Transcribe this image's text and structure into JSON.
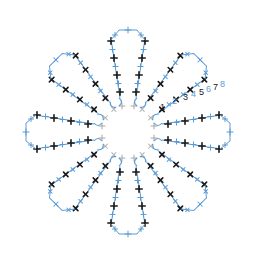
{
  "diagram": {
    "center": [
      128,
      132
    ],
    "petal_count": 8,
    "colors": {
      "black_stitch": "#1a1a1a",
      "blue_stitch": "#5b9bd5",
      "gray_stitch": "#a8a8a8",
      "background": "#ffffff"
    },
    "row_numbers": [
      {
        "label": "1",
        "x": 160,
        "y": 110,
        "color": "#1a1a1a"
      },
      {
        "label": "2",
        "x": 172,
        "y": 104,
        "color": "#5b9bd5"
      },
      {
        "label": "3",
        "x": 183,
        "y": 100,
        "color": "#1a1a1a"
      },
      {
        "label": "4",
        "x": 191,
        "y": 97,
        "color": "#5b9bd5"
      },
      {
        "label": "5",
        "x": 199,
        "y": 95,
        "color": "#1a1a1a"
      },
      {
        "label": "6",
        "x": 206,
        "y": 92,
        "color": "#5b9bd5"
      },
      {
        "label": "7",
        "x": 213,
        "y": 90,
        "color": "#1a1a1a"
      },
      {
        "label": "8",
        "x": 220,
        "y": 87,
        "color": "#5b9bd5"
      }
    ],
    "petals": [
      {
        "angle": -90
      },
      {
        "angle": -45
      },
      {
        "angle": 0
      },
      {
        "angle": 45
      },
      {
        "angle": 90
      },
      {
        "angle": 135
      },
      {
        "angle": 180
      },
      {
        "angle": 225
      }
    ]
  }
}
